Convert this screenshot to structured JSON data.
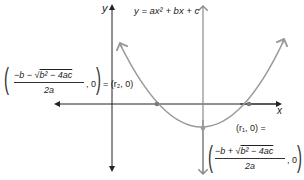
{
  "diagram": {
    "type": "parabola-roots",
    "equation_label": "y = ax² + bx + c",
    "axis_x_label": "x",
    "axis_y_label": "y",
    "root_left": {
      "fraction_numerator": "−b − √b² − 4ac",
      "numerator_prefix": "−b − ",
      "numerator_radicand": "b² − 4ac",
      "fraction_denominator": "2a",
      "coordinate_suffix": ", 0",
      "equals_text": "= (r₂, 0)"
    },
    "root_right": {
      "equals_text": "(r₁, 0) =",
      "fraction_numerator": "−b + √b² − 4ac",
      "numerator_prefix": "−b + ",
      "numerator_radicand": "b² − 4ac",
      "fraction_denominator": "2a",
      "coordinate_suffix": ", 0"
    },
    "colors": {
      "axis": "#222222",
      "parabola": "#9a9a9a",
      "symmetry_axis": "#8a8a8a",
      "points": "#7a7a7a"
    }
  }
}
